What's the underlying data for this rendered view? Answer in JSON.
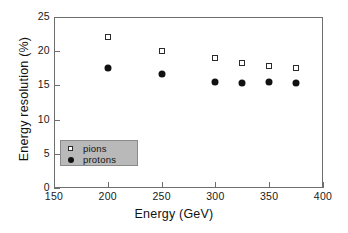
{
  "chart_data": {
    "type": "scatter",
    "title": "",
    "xlabel": "Energy (GeV)",
    "ylabel": "Energy resolution (%)",
    "xlim": [
      150,
      400
    ],
    "ylim": [
      0,
      25
    ],
    "xticks": [
      150,
      200,
      250,
      300,
      350,
      400
    ],
    "yticks": [
      0,
      5,
      10,
      15,
      20,
      25
    ],
    "xtick_labels": [
      "150",
      "200",
      "250",
      "300",
      "350",
      "400"
    ],
    "ytick_labels": [
      "0",
      "5",
      "10",
      "15",
      "20",
      "25"
    ],
    "grid": false,
    "legend_position": "lower-left-inside",
    "series": [
      {
        "name": "pions",
        "marker": "open-square",
        "color": "#2b2b2b",
        "x": [
          200,
          250,
          300,
          325,
          350,
          375
        ],
        "values": [
          22.1,
          20.1,
          19.0,
          18.3,
          17.8,
          17.5
        ]
      },
      {
        "name": "protons",
        "marker": "filled-circle",
        "color": "#111111",
        "x": [
          200,
          250,
          300,
          325,
          350,
          375
        ],
        "values": [
          17.6,
          16.7,
          15.5,
          15.4,
          15.5,
          15.3
        ]
      }
    ]
  },
  "legend": {
    "items": [
      {
        "label": "pions",
        "marker": "open-square"
      },
      {
        "label": "protons",
        "marker": "filled-circle"
      }
    ],
    "background_color": "#b9b9b9"
  },
  "style": {
    "axis_color": "#6e6e6e",
    "text_color": "#111111",
    "background": "#ffffff"
  }
}
